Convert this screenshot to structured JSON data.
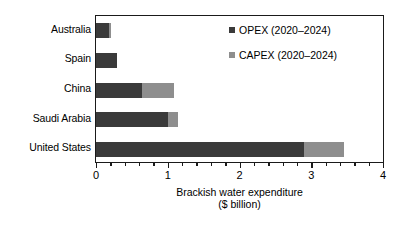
{
  "chart_data": {
    "type": "bar",
    "orientation": "horizontal",
    "title": "",
    "xlabel": "Brackish water expenditure ($ billion)",
    "xlabel_lines": [
      "Brackish water expenditure",
      "($ billion)"
    ],
    "ylabel": "",
    "categories": [
      "Australia",
      "Spain",
      "China",
      "Saudi Arabia",
      "United States"
    ],
    "series": [
      {
        "name": "OPEX (2020–2024)",
        "color": "#3a3a3a",
        "values": [
          0.18,
          0.29,
          0.64,
          1.01,
          2.9
        ]
      },
      {
        "name": "CAPEX (2020–2024)",
        "color": "#8e8e8e",
        "values": [
          0.03,
          0.0,
          0.45,
          0.14,
          0.56
        ]
      }
    ],
    "totals": [
      0.21,
      0.29,
      1.09,
      1.15,
      3.46
    ],
    "stacked": true,
    "xlim": [
      0,
      4
    ],
    "xticks": [
      0,
      1,
      2,
      3,
      4
    ],
    "xticklabels": [
      "0",
      "1",
      "2",
      "3",
      "4"
    ],
    "xminorticks": [
      0.2,
      0.4,
      0.6,
      0.8,
      1.2,
      1.4,
      1.6,
      1.8,
      2.2,
      2.4,
      2.6,
      2.8,
      3.2,
      3.4,
      3.6,
      3.8
    ],
    "grid": false,
    "legend_position": "upper right",
    "legend": [
      {
        "label": "OPEX (2020–2024)",
        "color": "#3a3a3a"
      },
      {
        "label": "CAPEX (2020–2024)",
        "color": "#8e8e8e"
      }
    ]
  }
}
